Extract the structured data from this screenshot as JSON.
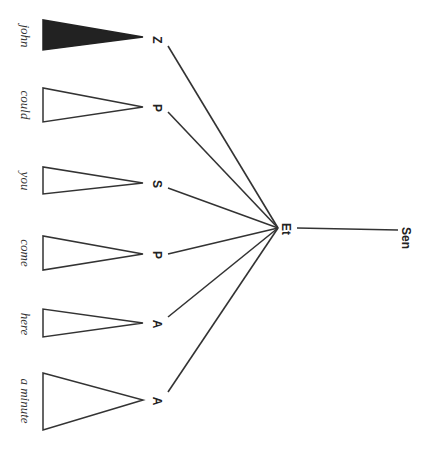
{
  "diagram": {
    "type": "syntax-tree",
    "orientation": "rotated-90-clockwise",
    "root": {
      "label": "Sen"
    },
    "mid": {
      "label": "Et"
    },
    "children": [
      {
        "label": "Z",
        "word": "john",
        "filled": true
      },
      {
        "label": "P",
        "word": "could",
        "filled": false
      },
      {
        "label": "S",
        "word": "you",
        "filled": false
      },
      {
        "label": "P",
        "word": "come",
        "filled": false
      },
      {
        "label": "A",
        "word": "here",
        "filled": false
      },
      {
        "label": "A",
        "word": "a minute",
        "filled": false
      }
    ],
    "colors": {
      "line": "#333333",
      "fill": "#222222",
      "background": "#ffffff"
    }
  }
}
